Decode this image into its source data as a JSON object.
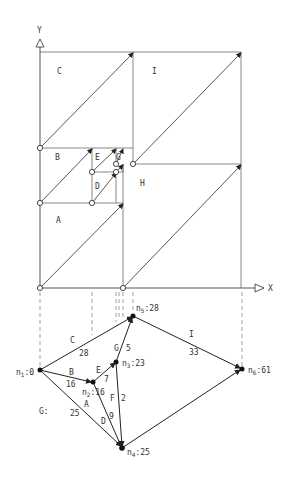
{
  "axes": {
    "y_label": "Y",
    "x_label": "X"
  },
  "regions": [
    {
      "id": "C",
      "label": "C",
      "x": 57,
      "y": 74
    },
    {
      "id": "I",
      "label": "I",
      "x": 154,
      "y": 74
    },
    {
      "id": "B",
      "label": "B",
      "x": 57,
      "y": 160
    },
    {
      "id": "E",
      "label": "E",
      "x": 95,
      "y": 160
    },
    {
      "id": "G",
      "label": "G",
      "x": 116,
      "y": 160
    },
    {
      "id": "D",
      "label": "D",
      "x": 95,
      "y": 188
    },
    {
      "id": "H",
      "label": "H",
      "x": 152,
      "y": 185
    },
    {
      "id": "A",
      "label": "A",
      "x": 57,
      "y": 222
    }
  ],
  "graph": {
    "name": "G:",
    "nodes": [
      {
        "id": "n1",
        "label": "n",
        "sub": "1",
        "value": ":0"
      },
      {
        "id": "n2",
        "label": "n",
        "sub": "2",
        "value": ":16"
      },
      {
        "id": "n3",
        "label": "n",
        "sub": "3",
        "value": ":23"
      },
      {
        "id": "n4",
        "label": "n",
        "sub": "4",
        "value": ":25"
      },
      {
        "id": "n5",
        "label": "n",
        "sub": "5",
        "value": ":28"
      },
      {
        "id": "n6",
        "label": "n",
        "sub": "6",
        "value": ":61"
      }
    ],
    "edges": [
      {
        "name": "C",
        "weight": "28",
        "from": "n1",
        "to": "n5"
      },
      {
        "name": "B",
        "weight": "16",
        "from": "n1",
        "to": "n2"
      },
      {
        "name": "A",
        "weight": "25",
        "from": "n1",
        "to": "n4"
      },
      {
        "name": "E",
        "weight": "7",
        "from": "n2",
        "to": "n3"
      },
      {
        "name": "D",
        "weight": "9",
        "from": "n2",
        "to": "n4"
      },
      {
        "name": "G",
        "weight": "5",
        "from": "n3",
        "to": "n5"
      },
      {
        "name": "F",
        "weight": "2",
        "from": "n3",
        "to": "n4"
      },
      {
        "name": "I",
        "weight": "33",
        "from": "n5",
        "to": "n6"
      },
      {
        "name": "H",
        "weight": "",
        "from": "n4",
        "to": "n6"
      }
    ]
  }
}
